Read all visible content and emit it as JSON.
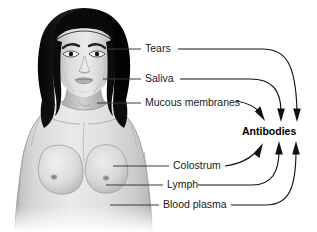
{
  "figure": {
    "background_color": "#ffffff",
    "width": 317,
    "height": 232
  },
  "illustration": {
    "name": "woman-head-and-torso",
    "description": "Grayscale anatomical drawing of a woman's head, neck, shoulders and bare chest, front view",
    "colors": {
      "hair": "#111111",
      "skin_light": "#e4e4e4",
      "skin_mid": "#cfcfcf",
      "skin_shadow": "#ababab",
      "outline": "#6b6b6b"
    }
  },
  "labels": [
    {
      "id": "tears",
      "text": "Tears"
    },
    {
      "id": "saliva",
      "text": "Saliva"
    },
    {
      "id": "mucous-membranes",
      "text": "Mucous membranes"
    },
    {
      "id": "colostrum",
      "text": "Colostrum"
    },
    {
      "id": "lymph",
      "text": "Lymph"
    },
    {
      "id": "blood-plasma",
      "text": "Blood plasma"
    }
  ],
  "target": {
    "id": "antibodies",
    "text": "Antibodies",
    "bold": true,
    "color": "#000000"
  },
  "connector_colors": {
    "leader_line": "#3a3a3a",
    "flow_arrow": "#111111"
  }
}
